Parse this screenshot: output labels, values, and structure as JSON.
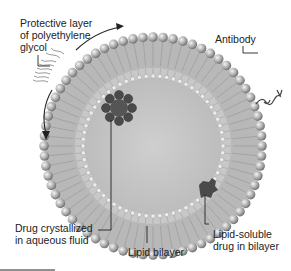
{
  "diagram": {
    "labels": {
      "peg": [
        "Protective layer",
        "of polyethylene",
        "glycol"
      ],
      "antibody": "Antibody",
      "drug_aqueous": [
        "Drug crystallized",
        "in aqueous fluid"
      ],
      "lipid_bilayer": "Lipid bilayer",
      "lipid_soluble": [
        "Lipid-soluble",
        "drug in bilayer"
      ]
    },
    "colors": {
      "head": "#9a9a9a",
      "head_highlight": "#e8e8e8",
      "tail": "#b5b5b5",
      "core": "#c4c4c4",
      "drug": "#555555",
      "line": "#222222"
    }
  }
}
